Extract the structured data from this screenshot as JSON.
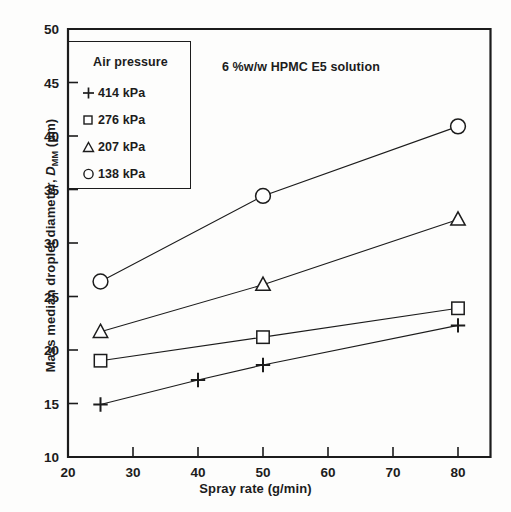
{
  "chart_data": {
    "type": "line",
    "title": "",
    "annotation": "6 %w/w HPMC E5 solution",
    "xlabel": "Spray rate (g/min)",
    "ylabel_prefix": "Mass median droplet diameter, ",
    "ylabel_var": "D",
    "ylabel_sub": "MM",
    "ylabel_units": " (μm)",
    "ylabel_full": "Mass median droplet diameter, D_MM (μm)",
    "xlim": [
      20,
      85
    ],
    "ylim": [
      10,
      50
    ],
    "xticks": [
      20,
      30,
      40,
      50,
      60,
      70,
      80
    ],
    "yticks": [
      10,
      15,
      20,
      25,
      30,
      35,
      40,
      45,
      50
    ],
    "xtick_labels": [
      "20",
      "30",
      "40",
      "50",
      "60",
      "70",
      "80"
    ],
    "ytick_labels": [
      "10",
      "15",
      "20",
      "25",
      "30",
      "35",
      "40",
      "45",
      "50"
    ],
    "grid": false,
    "legend_position": "upper-left-inset",
    "legend_title": "Air pressure",
    "series": [
      {
        "name": "414 kPa",
        "marker": "plus",
        "x": [
          25,
          40,
          50,
          80
        ],
        "values": [
          14.9,
          17.2,
          18.6,
          22.3
        ]
      },
      {
        "name": "276 kPa",
        "marker": "square",
        "x": [
          25,
          50,
          80
        ],
        "values": [
          19.0,
          21.2,
          23.9
        ]
      },
      {
        "name": "207 kPa",
        "marker": "triangle",
        "x": [
          25,
          50,
          80
        ],
        "values": [
          21.7,
          26.1,
          32.2
        ]
      },
      {
        "name": "138 kPa",
        "marker": "circle",
        "x": [
          25,
          50,
          80
        ],
        "values": [
          26.4,
          34.4,
          40.9
        ]
      }
    ],
    "colors": {
      "line": "#1c1c1c",
      "marker_fill": "#ffffff",
      "axis": "#1c1c1c",
      "background": "#fdfdfc"
    }
  },
  "legend": {
    "title": "Air pressure",
    "items": [
      {
        "symbol": "plus",
        "label": "414 kPa"
      },
      {
        "symbol": "square",
        "label": "276 kPa"
      },
      {
        "symbol": "triangle",
        "label": "207 kPa"
      },
      {
        "symbol": "circle",
        "label": "138 kPa"
      }
    ]
  },
  "axes": {
    "x_title": "Spray rate (g/min)",
    "y_title": "Mass median droplet diameter, D_MM (μm)"
  },
  "annotation": {
    "text": "6 %w/w HPMC E5 solution"
  }
}
